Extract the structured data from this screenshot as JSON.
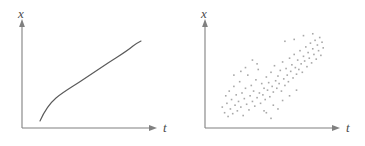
{
  "figure": {
    "background_color": "#ffffff",
    "axis_color": "#808080",
    "curve_color": "#5a5a5a",
    "point_color": "#a8a8a8"
  },
  "panels": [
    {
      "name": "deterministic-curve-panel",
      "y_axis_label": "x",
      "x_axis_label": "t",
      "axis": {
        "origin_x": 22,
        "origin_y": 128,
        "x_end": 158,
        "y_top": 22
      }
    },
    {
      "name": "scatter-panel",
      "y_axis_label": "x",
      "x_axis_label": "t",
      "axis": {
        "origin_x": 22,
        "origin_y": 128,
        "x_end": 158,
        "y_top": 22
      }
    }
  ],
  "chart_data": [
    {
      "type": "line",
      "title": "",
      "xlabel": "t",
      "ylabel": "x",
      "grid": false,
      "legend": "none",
      "xlim": [
        0,
        1
      ],
      "ylim": [
        0,
        1
      ],
      "description": "Smooth monotonically increasing S-shaped (sigmoid) curve",
      "x": [
        0.13,
        0.16,
        0.19,
        0.23,
        0.27,
        0.32,
        0.38,
        0.45,
        0.52,
        0.6,
        0.67,
        0.74,
        0.8,
        0.85,
        0.89,
        0.92,
        0.95
      ],
      "y": [
        0.08,
        0.14,
        0.2,
        0.26,
        0.31,
        0.35,
        0.39,
        0.43,
        0.47,
        0.52,
        0.57,
        0.63,
        0.69,
        0.75,
        0.8,
        0.85,
        0.9
      ]
    },
    {
      "type": "scatter",
      "title": "",
      "xlabel": "t",
      "ylabel": "x",
      "grid": false,
      "legend": "none",
      "xlim": [
        0,
        1
      ],
      "ylim": [
        0,
        1
      ],
      "description": "Noisy positively correlated cloud of points, denser at lower left, rising to upper right",
      "n_points": 104,
      "points": [
        [
          0.08,
          0.18
        ],
        [
          0.1,
          0.12
        ],
        [
          0.11,
          0.3
        ],
        [
          0.12,
          0.22
        ],
        [
          0.13,
          0.08
        ],
        [
          0.14,
          0.35
        ],
        [
          0.15,
          0.16
        ],
        [
          0.16,
          0.26
        ],
        [
          0.17,
          0.11
        ],
        [
          0.18,
          0.4
        ],
        [
          0.19,
          0.2
        ],
        [
          0.2,
          0.31
        ],
        [
          0.21,
          0.14
        ],
        [
          0.22,
          0.24
        ],
        [
          0.23,
          0.45
        ],
        [
          0.24,
          0.18
        ],
        [
          0.25,
          0.33
        ],
        [
          0.26,
          0.09
        ],
        [
          0.27,
          0.27
        ],
        [
          0.28,
          0.38
        ],
        [
          0.29,
          0.21
        ],
        [
          0.3,
          0.52
        ],
        [
          0.31,
          0.15
        ],
        [
          0.32,
          0.3
        ],
        [
          0.33,
          0.41
        ],
        [
          0.34,
          0.24
        ],
        [
          0.35,
          0.35
        ],
        [
          0.36,
          0.19
        ],
        [
          0.37,
          0.47
        ],
        [
          0.38,
          0.28
        ],
        [
          0.39,
          0.58
        ],
        [
          0.4,
          0.33
        ],
        [
          0.41,
          0.22
        ],
        [
          0.42,
          0.43
        ],
        [
          0.43,
          0.31
        ],
        [
          0.44,
          0.38
        ],
        [
          0.45,
          0.26
        ],
        [
          0.46,
          0.5
        ],
        [
          0.47,
          0.36
        ],
        [
          0.48,
          0.44
        ],
        [
          0.49,
          0.29
        ],
        [
          0.5,
          0.55
        ],
        [
          0.51,
          0.4
        ],
        [
          0.52,
          0.34
        ],
        [
          0.53,
          0.62
        ],
        [
          0.54,
          0.46
        ],
        [
          0.55,
          0.38
        ],
        [
          0.56,
          0.51
        ],
        [
          0.57,
          0.43
        ],
        [
          0.58,
          0.57
        ],
        [
          0.59,
          0.35
        ],
        [
          0.6,
          0.66
        ],
        [
          0.61,
          0.48
        ],
        [
          0.62,
          0.41
        ],
        [
          0.63,
          0.59
        ],
        [
          0.64,
          0.52
        ],
        [
          0.65,
          0.45
        ],
        [
          0.66,
          0.7
        ],
        [
          0.67,
          0.56
        ],
        [
          0.68,
          0.63
        ],
        [
          0.69,
          0.49
        ],
        [
          0.7,
          0.74
        ],
        [
          0.71,
          0.6
        ],
        [
          0.72,
          0.53
        ],
        [
          0.73,
          0.68
        ],
        [
          0.74,
          0.58
        ],
        [
          0.75,
          0.78
        ],
        [
          0.76,
          0.64
        ],
        [
          0.77,
          0.55
        ],
        [
          0.78,
          0.72
        ],
        [
          0.79,
          0.67
        ],
        [
          0.8,
          0.82
        ],
        [
          0.81,
          0.61
        ],
        [
          0.82,
          0.76
        ],
        [
          0.83,
          0.7
        ],
        [
          0.84,
          0.86
        ],
        [
          0.85,
          0.65
        ],
        [
          0.86,
          0.8
        ],
        [
          0.87,
          0.74
        ],
        [
          0.88,
          0.89
        ],
        [
          0.89,
          0.69
        ],
        [
          0.9,
          0.84
        ],
        [
          0.91,
          0.78
        ],
        [
          0.92,
          0.92
        ],
        [
          0.93,
          0.73
        ],
        [
          0.94,
          0.87
        ],
        [
          0.95,
          0.81
        ],
        [
          0.34,
          0.68
        ],
        [
          0.28,
          0.6
        ],
        [
          0.52,
          0.2
        ],
        [
          0.6,
          0.25
        ],
        [
          0.44,
          0.14
        ],
        [
          0.66,
          0.3
        ],
        [
          0.72,
          0.36
        ],
        [
          0.18,
          0.52
        ],
        [
          0.24,
          0.56
        ],
        [
          0.38,
          0.64
        ],
        [
          0.46,
          0.12
        ],
        [
          0.56,
          0.16
        ],
        [
          0.62,
          0.88
        ],
        [
          0.7,
          0.9
        ],
        [
          0.78,
          0.94
        ],
        [
          0.86,
          0.96
        ],
        [
          0.5,
          0.06
        ]
      ]
    }
  ]
}
